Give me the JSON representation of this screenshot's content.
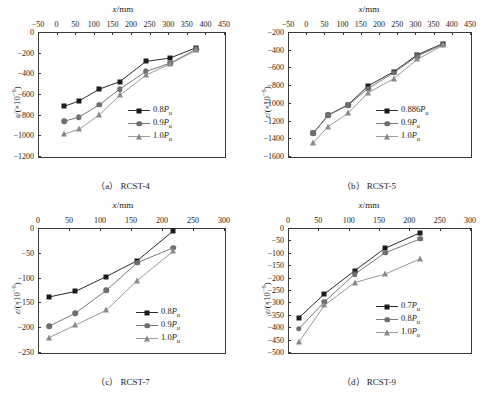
{
  "figure": {
    "axis_titles": {
      "x": "x/mm",
      "y_prefix": "ε/(×10",
      "y_exp": "−6",
      "y_suffix": ")"
    },
    "panels": [
      {
        "key": "a",
        "caption": "（a） RCST-4"
      },
      {
        "key": "b",
        "caption": "（b） RCST-5"
      },
      {
        "key": "c",
        "caption": "（c） RCST-7"
      },
      {
        "key": "d",
        "caption": "（d） RCST-9"
      }
    ]
  },
  "chart_data": [
    {
      "type": "line",
      "panel": "a",
      "title": "（a） RCST-4",
      "xlabel": "x/mm",
      "ylabel": "ε/(×10⁻⁶)",
      "xlim": [
        -50,
        450
      ],
      "ylim": [
        -1200,
        0
      ],
      "xticks": [
        -50,
        0,
        50,
        100,
        150,
        200,
        250,
        300,
        350,
        400,
        450
      ],
      "yticks": [
        0,
        -200,
        -400,
        -600,
        -800,
        -1000,
        -1200
      ],
      "grid": false,
      "legend_position": "lower-right",
      "x": [
        20,
        60,
        115,
        170,
        240,
        305,
        375
      ],
      "series": [
        {
          "name": "0.8Pᵤ",
          "marker": "square",
          "values": [
            -720,
            -668,
            -553,
            -480,
            -285,
            -252,
            -152
          ]
        },
        {
          "name": "0.9Pᵤ",
          "marker": "circle",
          "values": [
            -865,
            -824,
            -705,
            -552,
            -382,
            -302,
            -167
          ]
        },
        {
          "name": "1.0Pᵤ",
          "marker": "triangle",
          "values": [
            -988,
            -942,
            -802,
            -613,
            -418,
            -308,
            -178
          ]
        }
      ]
    },
    {
      "type": "line",
      "panel": "b",
      "title": "（b） RCST-5",
      "xlabel": "x/mm",
      "ylabel": "ε/(×10⁻⁶)",
      "xlim": [
        -50,
        450
      ],
      "ylim": [
        -1600,
        -200
      ],
      "xticks": [
        -50,
        0,
        50,
        100,
        150,
        200,
        250,
        300,
        350,
        400,
        450
      ],
      "yticks": [
        -200,
        -400,
        -600,
        -800,
        -1000,
        -1200,
        -1400,
        -1600
      ],
      "grid": false,
      "legend_position": "lower-right",
      "x": [
        20,
        60,
        115,
        170,
        240,
        305,
        375
      ],
      "series": [
        {
          "name": "0.886Pᵤ",
          "marker": "square",
          "values": [
            -1340,
            -1138,
            -1022,
            -808,
            -650,
            -458,
            -332
          ]
        },
        {
          "name": "0.9Pᵤ",
          "marker": "circle",
          "values": [
            -1344,
            -1142,
            -1026,
            -838,
            -662,
            -472,
            -342
          ]
        },
        {
          "name": "1.0Pᵤ",
          "marker": "triangle",
          "values": [
            -1448,
            -1268,
            -1118,
            -888,
            -728,
            -510,
            -352
          ]
        }
      ]
    },
    {
      "type": "line",
      "panel": "c",
      "title": "（c） RCST-7",
      "xlabel": "x/mm",
      "ylabel": "ε/(×10⁻⁶)",
      "xlim": [
        0,
        300
      ],
      "ylim": [
        -250,
        0
      ],
      "xticks": [
        0,
        50,
        100,
        150,
        200,
        250,
        300
      ],
      "yticks": [
        0,
        -50,
        -100,
        -150,
        -200,
        -250
      ],
      "grid": false,
      "legend_position": "lower-right",
      "x": [
        18,
        60,
        110,
        160,
        218
      ],
      "series": [
        {
          "name": "0.8Pᵤ",
          "marker": "square",
          "values": [
            -139,
            -128,
            -98,
            -66,
            -6
          ]
        },
        {
          "name": "0.9Pᵤ",
          "marker": "circle",
          "values": [
            -198,
            -172,
            -126,
            -70,
            -40
          ]
        },
        {
          "name": "1.0Pᵤ",
          "marker": "triangle",
          "values": [
            -221,
            -196,
            -166,
            -106,
            -47
          ]
        }
      ]
    },
    {
      "type": "line",
      "panel": "d",
      "title": "（d） RCST-9",
      "xlabel": "x/mm",
      "ylabel": "ε/(×10⁻⁶)",
      "xlim": [
        0,
        300
      ],
      "ylim": [
        -500,
        0
      ],
      "xticks": [
        0,
        50,
        100,
        150,
        200,
        250,
        300
      ],
      "yticks": [
        0,
        -50,
        -100,
        -150,
        -200,
        -250,
        -300,
        -350,
        -400,
        -450,
        -500
      ],
      "grid": false,
      "legend_position": "lower-right",
      "x": [
        18,
        60,
        110,
        160,
        218
      ],
      "series": [
        {
          "name": "0.7Pᵤ",
          "marker": "square",
          "values": [
            -362,
            -266,
            -172,
            -82,
            -19
          ]
        },
        {
          "name": "0.8Pᵤ",
          "marker": "circle",
          "values": [
            -406,
            -298,
            -186,
            -100,
            -44
          ]
        },
        {
          "name": "1.0Pᵤ",
          "marker": "triangle",
          "values": [
            -460,
            -312,
            -220,
            -186,
            -124
          ]
        }
      ]
    }
  ]
}
